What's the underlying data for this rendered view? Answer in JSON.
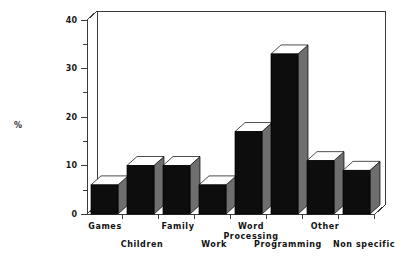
{
  "chart_data": {
    "type": "bar",
    "title": "",
    "subtitle": "",
    "xlabel": "",
    "ylabel": "%",
    "ylim": [
      0,
      40
    ],
    "y_ticks": [
      0,
      10,
      20,
      30,
      40
    ],
    "y_minor_ticks": [
      5,
      15,
      25,
      35
    ],
    "grid": false,
    "legend": null,
    "style": "3d-bar",
    "categories": [
      "Games",
      "Children",
      "Family",
      "Work",
      "Word Processing",
      "Programming",
      "Other",
      "Non specific"
    ],
    "values": [
      6,
      10,
      10,
      6,
      17,
      33,
      11,
      9
    ],
    "series": [
      {
        "name": "Percentage",
        "values": [
          6,
          10,
          10,
          6,
          17,
          33,
          11,
          9
        ]
      }
    ],
    "annotations": []
  },
  "axes": {
    "y_axis_title": "%",
    "y_tick_labels": [
      "0",
      "10",
      "20",
      "30",
      "40"
    ],
    "y_axis_min": 0,
    "y_axis_max": 40
  },
  "category_labels": [
    {
      "text": "Games",
      "row": "top"
    },
    {
      "text": "Children",
      "row": "bottom"
    },
    {
      "text": "Family",
      "row": "top"
    },
    {
      "text": "Work",
      "row": "bottom"
    },
    {
      "text": "Word",
      "row": "top"
    },
    {
      "text": "Processing",
      "row": "mid"
    },
    {
      "text": "Programming",
      "row": "bottom"
    },
    {
      "text": "Other",
      "row": "top"
    },
    {
      "text": "Non  specific",
      "row": "bottom"
    }
  ],
  "colors": {
    "bar_front": "#0d0d0d",
    "bar_side": "#6e6e6e",
    "bar_top": "#ffffff",
    "axis": "#3a3a3a",
    "text": "#111111",
    "background": "#ffffff"
  }
}
